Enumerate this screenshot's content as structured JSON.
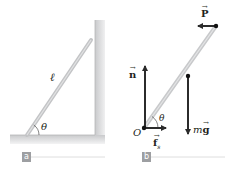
{
  "panels": [
    {
      "id": "a",
      "tag_label": "a",
      "labels": {
        "length": "ℓ",
        "angle": "θ"
      }
    },
    {
      "id": "b",
      "tag_label": "b",
      "labels": {
        "origin": "O",
        "angle": "θ",
        "normal_force": "n",
        "applied_force": "P",
        "friction_force": "f",
        "friction_subscript": "s",
        "gravity_m": "m",
        "gravity_g": "g",
        "vector_arrow": "→"
      }
    }
  ],
  "colors": {
    "ladder": "#c8c9cb",
    "wall": "#d9dadb",
    "arrow": "#2b2b2b",
    "tag_bg": "#9d9fa2",
    "rule": "#d0d0d0"
  }
}
